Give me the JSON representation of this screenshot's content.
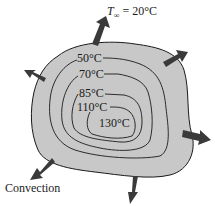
{
  "diagram": {
    "ambient_label_symbol": "T",
    "ambient_label_subscript": "∞",
    "ambient_label_value": " = 20°C",
    "isotherms": [
      {
        "label": "50°C"
      },
      {
        "label": "70°C"
      },
      {
        "label": "85°C"
      },
      {
        "label": "110°C"
      },
      {
        "label": "130°C"
      }
    ],
    "convection_label": "Convection",
    "colors": {
      "body_fill": "#c8c8c8",
      "outline": "#1a1a1a",
      "arrow": "#3a3a3a"
    }
  }
}
